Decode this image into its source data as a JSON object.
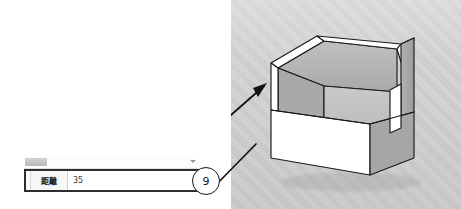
{
  "app": {
    "tool": "tape-measure",
    "viewport_bg": "#cfcfcf"
  },
  "vcb": {
    "toolbar": {
      "title": "",
      "dropdown_icon": "chevron-down-icon",
      "handle": "drag-handle"
    },
    "label": "距離",
    "value": "35",
    "placeholder": "35"
  },
  "callout": {
    "number": "9",
    "arrow_icon": "leader-arrow-icon",
    "points_to": "inner-left-wall"
  },
  "model": {
    "name": "open-top-box",
    "faces": {
      "left_outer": "#ffffff",
      "left_inner": "#a8a8a8",
      "back_inner": "#b4b4b4",
      "right_outer": "#a6a6a6",
      "floor_inner": "#c2c2c2",
      "front_band": "#ffffff",
      "rim_top": "#ffffff"
    },
    "edge_color": "#1a1a1a"
  }
}
